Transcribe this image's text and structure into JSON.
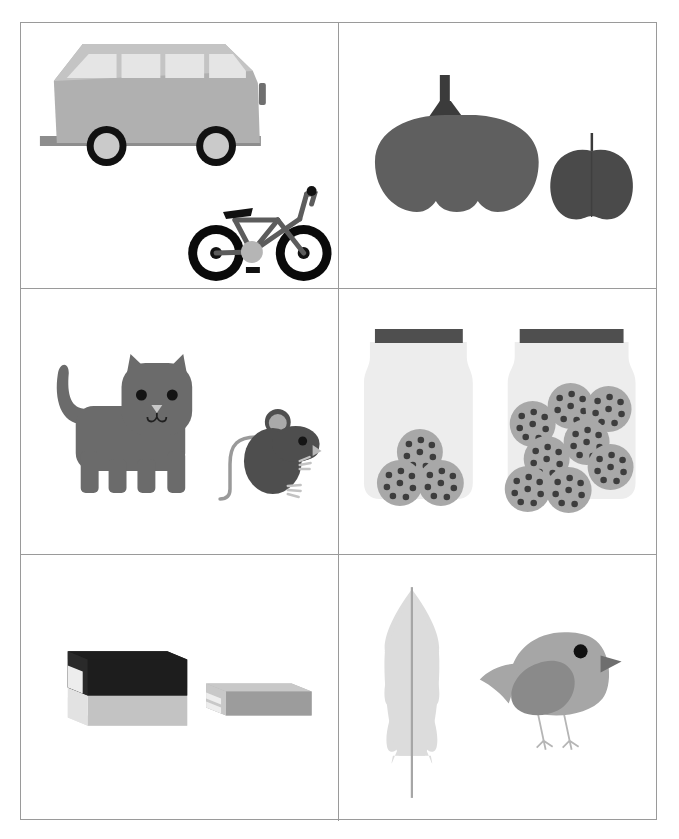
{
  "page": {
    "width": 679,
    "height": 839,
    "background": "#ffffff",
    "border_color": "#9a9a9a",
    "layout": "2-column x 3-row picture grid",
    "title": ""
  },
  "palette": {
    "van_body": "#b0b0b0",
    "van_roof": "#c4c4c4",
    "van_window": "#e0e0e0",
    "van_bumper": "#8d8d8d",
    "van_wheel_tire": "#111111",
    "van_wheel_hub": "#c9c9c9",
    "bike_frame": "#5c5c5c",
    "bike_tire": "#0a0a0a",
    "bike_hub": "#111111",
    "bike_seat": "#111111",
    "bike_pedal_gear": "#b5b5b5",
    "pumpkin_body": "#5f5f5f",
    "pumpkin_stem": "#3b3b3b",
    "apple_body": "#4a4a4a",
    "apple_stem": "#3a3a3a",
    "cat_body": "#6b6b6b",
    "cat_eye": "#141414",
    "cat_nose": "#c8c8c8",
    "mouse_body": "#4e4e4e",
    "mouse_ear": "#a9a9a9",
    "mouse_tail": "#9a9a9a",
    "mouse_foot": "#c3c3c3",
    "jar_glass": "#ededed",
    "jar_lid": "#4f4f4f",
    "cookie_body": "#a8a8a8",
    "cookie_chip": "#3d3d3d",
    "book_dark_cover": "#1d1d1d",
    "book_light_cover": "#b4b4b4",
    "book_pages": "#e2e2e2",
    "book_side": "#9c9c9c",
    "feather_vane": "#dcdcdc",
    "feather_shaft": "#a6a6a6",
    "bird_body": "#a6a6a6",
    "bird_wing": "#8a8a8a",
    "bird_beak": "#6e6e6e",
    "bird_eye": "#111111",
    "bird_leg": "#b5b5b5"
  },
  "cells": [
    {
      "id": "cell-1",
      "row": 1,
      "col": 1,
      "name": "vehicles-cell",
      "objects": [
        {
          "name": "van",
          "label": "van",
          "count": 1,
          "size": "large"
        },
        {
          "name": "bicycle",
          "label": "bicycle",
          "count": 1,
          "size": "small"
        }
      ],
      "comparison": "big vs small vehicle"
    },
    {
      "id": "cell-2",
      "row": 1,
      "col": 2,
      "name": "produce-cell",
      "objects": [
        {
          "name": "pumpkin",
          "label": "pumpkin",
          "count": 1,
          "size": "large"
        },
        {
          "name": "apple",
          "label": "apple",
          "count": 1,
          "size": "small"
        }
      ],
      "comparison": "big vs small fruit"
    },
    {
      "id": "cell-3",
      "row": 2,
      "col": 1,
      "name": "animals-cell",
      "objects": [
        {
          "name": "cat",
          "label": "cat",
          "count": 1,
          "size": "large"
        },
        {
          "name": "mouse",
          "label": "mouse",
          "count": 1,
          "size": "small"
        }
      ],
      "comparison": "big vs small animal"
    },
    {
      "id": "cell-4",
      "row": 2,
      "col": 2,
      "name": "cookie-jars-cell",
      "objects": [
        {
          "name": "jar-left",
          "label": "jar with few cookies",
          "count": 1,
          "cookies": 3,
          "size": "small jar"
        },
        {
          "name": "jar-right",
          "label": "jar with many cookies",
          "count": 1,
          "cookies": 8,
          "size": "large jar"
        }
      ],
      "comparison": "few vs many cookies"
    },
    {
      "id": "cell-5",
      "row": 3,
      "col": 1,
      "name": "books-cell",
      "objects": [
        {
          "name": "thick-book",
          "label": "thick book",
          "count": 1,
          "size": "thick"
        },
        {
          "name": "thin-book",
          "label": "thin book",
          "count": 1,
          "size": "thin"
        }
      ],
      "comparison": "thick vs thin book"
    },
    {
      "id": "cell-6",
      "row": 3,
      "col": 2,
      "name": "feather-bird-cell",
      "objects": [
        {
          "name": "feather",
          "label": "feather",
          "count": 1,
          "size": "tall"
        },
        {
          "name": "bird",
          "label": "bird",
          "count": 1,
          "size": "small"
        }
      ],
      "comparison": "feather and bird"
    }
  ]
}
